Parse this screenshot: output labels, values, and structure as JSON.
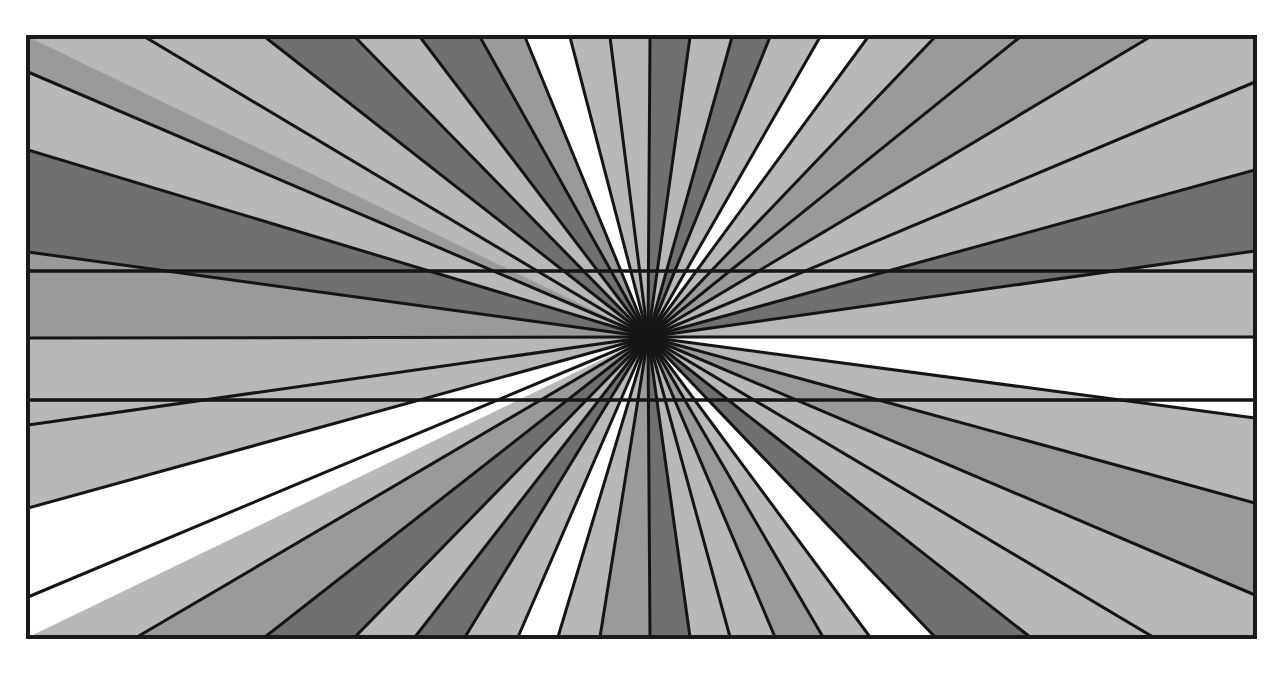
{
  "figure": {
    "title": "Hering illusion: radial wedges with two parallel horizontal lines",
    "canvas": {
      "width": 1285,
      "height": 673,
      "background": "#ffffff"
    },
    "frame": {
      "x1": 28,
      "y1": 37,
      "x2": 1255,
      "y2": 637,
      "stroke": "#1a1a1a",
      "stroke_width": 4
    },
    "center": {
      "x": 648,
      "y": 337
    },
    "ray_stroke": {
      "color": "#151515",
      "width": 3
    },
    "shades": {
      "white": "#ffffff",
      "light": "#b8b8b8",
      "medium": "#9a9a9a",
      "dark": "#707070"
    },
    "horizontal_lines": [
      {
        "name": "upper-line",
        "y": 271,
        "color": "#151515",
        "width": 3.5
      },
      {
        "name": "lower-line",
        "y": 400,
        "color": "#151515",
        "width": 3.5
      }
    ],
    "boundary_points": [
      [
        28,
        37
      ],
      [
        145,
        37
      ],
      [
        265,
        37
      ],
      [
        355,
        37
      ],
      [
        420,
        37
      ],
      [
        480,
        37
      ],
      [
        525,
        37
      ],
      [
        570,
        37
      ],
      [
        610,
        37
      ],
      [
        650,
        37
      ],
      [
        690,
        37
      ],
      [
        732,
        37
      ],
      [
        770,
        37
      ],
      [
        820,
        37
      ],
      [
        868,
        37
      ],
      [
        935,
        37
      ],
      [
        1020,
        37
      ],
      [
        1150,
        37
      ],
      [
        1255,
        37
      ],
      [
        1255,
        82
      ],
      [
        1255,
        170
      ],
      [
        1255,
        251
      ],
      [
        1255,
        337
      ],
      [
        1255,
        418
      ],
      [
        1255,
        503
      ],
      [
        1255,
        595
      ],
      [
        1255,
        637
      ],
      [
        1153,
        637
      ],
      [
        1030,
        637
      ],
      [
        935,
        637
      ],
      [
        870,
        637
      ],
      [
        823,
        637
      ],
      [
        775,
        637
      ],
      [
        730,
        637
      ],
      [
        690,
        637
      ],
      [
        650,
        637
      ],
      [
        600,
        637
      ],
      [
        558,
        637
      ],
      [
        518,
        637
      ],
      [
        465,
        637
      ],
      [
        415,
        637
      ],
      [
        355,
        637
      ],
      [
        265,
        637
      ],
      [
        137,
        637
      ],
      [
        28,
        637
      ],
      [
        28,
        597
      ],
      [
        28,
        508
      ],
      [
        28,
        425
      ],
      [
        28,
        338
      ],
      [
        28,
        252
      ],
      [
        28,
        150
      ],
      [
        28,
        72
      ]
    ],
    "wedge_fills": [
      "light",
      "light",
      "dark",
      "light",
      "dark",
      "medium",
      "white",
      "light",
      "light",
      "dark",
      "light",
      "dark",
      "light",
      "white",
      "light",
      "medium",
      "medium",
      "light",
      "light",
      "light",
      "dark",
      "light",
      "white",
      "light",
      "medium",
      "light",
      "light",
      "light",
      "dark",
      "white",
      "light",
      "medium",
      "light",
      "light",
      "dark",
      "medium",
      "light",
      "white",
      "light",
      "dark",
      "light",
      "dark",
      "medium",
      "light",
      "white",
      "white",
      "light",
      "light",
      "medium",
      "dark",
      "light",
      "medium",
      "white",
      "light"
    ]
  }
}
